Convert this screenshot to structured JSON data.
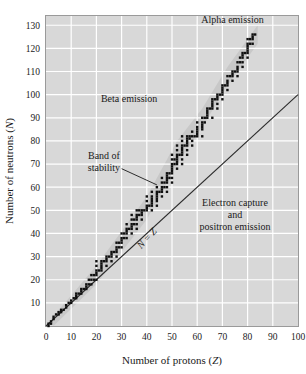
{
  "chart_data": {
    "type": "scatter",
    "title": "",
    "xlabel": "Number of protons (Z)",
    "ylabel": "Number of neutrons (N)",
    "xlim": [
      0,
      100
    ],
    "ylim": [
      0,
      134
    ],
    "grid": true,
    "grid_color": "#ffffff",
    "plot_bg": "#d8d8d8",
    "band_color": "#c6c6c6",
    "point_color": "#101010",
    "line_color": "#2b2b2b",
    "xticks": [
      0,
      10,
      20,
      30,
      40,
      50,
      60,
      70,
      80,
      90,
      100
    ],
    "yticks": [
      10,
      20,
      30,
      40,
      50,
      60,
      70,
      80,
      90,
      100,
      110,
      120,
      130
    ],
    "legend_position": "none",
    "annotations": [
      {
        "name": "alpha-emission",
        "text": "Alpha emission",
        "x": 74,
        "y": 131,
        "anchor": "middle"
      },
      {
        "name": "beta-emission",
        "text": "Beta emission",
        "x": 33,
        "y": 97,
        "anchor": "middle"
      },
      {
        "name": "band-of-stability",
        "text": "Band of stability",
        "lines": [
          "Band of",
          "stability"
        ],
        "x": 23,
        "y": 72,
        "anchor": "middle"
      },
      {
        "name": "electron-capture",
        "text": "Electron capture and positron emission",
        "lines": [
          "Electron capture",
          "and",
          "positron emission"
        ],
        "x": 75,
        "y": 52,
        "anchor": "middle"
      },
      {
        "name": "n-equals-z",
        "text": "N = Z",
        "x": 41,
        "y": 37,
        "rotation": -48
      }
    ],
    "reference_line": {
      "name": "n-equals-z-line",
      "label": "N = Z",
      "from": [
        0,
        0
      ],
      "to": [
        100,
        100
      ]
    },
    "leader_line": {
      "name": "band-of-stability-leader",
      "from": [
        30,
        68
      ],
      "to": [
        44,
        61
      ]
    },
    "series": [
      {
        "name": "Stable nuclides",
        "marker": "square",
        "points": [
          [
            1,
            0
          ],
          [
            1,
            1
          ],
          [
            2,
            1
          ],
          [
            2,
            2
          ],
          [
            3,
            3
          ],
          [
            3,
            4
          ],
          [
            4,
            5
          ],
          [
            5,
            5
          ],
          [
            5,
            6
          ],
          [
            6,
            6
          ],
          [
            6,
            7
          ],
          [
            7,
            7
          ],
          [
            8,
            8
          ],
          [
            8,
            9
          ],
          [
            9,
            10
          ],
          [
            10,
            10
          ],
          [
            10,
            11
          ],
          [
            11,
            12
          ],
          [
            12,
            12
          ],
          [
            12,
            13
          ],
          [
            12,
            14
          ],
          [
            13,
            14
          ],
          [
            14,
            14
          ],
          [
            14,
            15
          ],
          [
            14,
            16
          ],
          [
            15,
            16
          ],
          [
            16,
            16
          ],
          [
            16,
            17
          ],
          [
            16,
            18
          ],
          [
            17,
            18
          ],
          [
            17,
            20
          ],
          [
            18,
            18
          ],
          [
            18,
            20
          ],
          [
            18,
            22
          ],
          [
            19,
            20
          ],
          [
            19,
            22
          ],
          [
            20,
            20
          ],
          [
            20,
            22
          ],
          [
            20,
            23
          ],
          [
            20,
            24
          ],
          [
            20,
            26
          ],
          [
            20,
            28
          ],
          [
            21,
            24
          ],
          [
            22,
            24
          ],
          [
            22,
            25
          ],
          [
            22,
            26
          ],
          [
            22,
            27
          ],
          [
            22,
            28
          ],
          [
            23,
            28
          ],
          [
            24,
            26
          ],
          [
            24,
            28
          ],
          [
            24,
            29
          ],
          [
            24,
            30
          ],
          [
            25,
            30
          ],
          [
            26,
            28
          ],
          [
            26,
            30
          ],
          [
            26,
            31
          ],
          [
            26,
            32
          ],
          [
            27,
            32
          ],
          [
            28,
            30
          ],
          [
            28,
            32
          ],
          [
            28,
            33
          ],
          [
            28,
            34
          ],
          [
            28,
            36
          ],
          [
            29,
            34
          ],
          [
            29,
            36
          ],
          [
            30,
            34
          ],
          [
            30,
            36
          ],
          [
            30,
            37
          ],
          [
            30,
            38
          ],
          [
            30,
            40
          ],
          [
            31,
            38
          ],
          [
            31,
            40
          ],
          [
            32,
            38
          ],
          [
            32,
            40
          ],
          [
            32,
            41
          ],
          [
            32,
            42
          ],
          [
            32,
            44
          ],
          [
            33,
            42
          ],
          [
            34,
            40
          ],
          [
            34,
            42
          ],
          [
            34,
            43
          ],
          [
            34,
            44
          ],
          [
            34,
            46
          ],
          [
            34,
            48
          ],
          [
            35,
            44
          ],
          [
            35,
            46
          ],
          [
            36,
            42
          ],
          [
            36,
            44
          ],
          [
            36,
            46
          ],
          [
            36,
            47
          ],
          [
            36,
            48
          ],
          [
            36,
            50
          ],
          [
            37,
            48
          ],
          [
            37,
            50
          ],
          [
            38,
            46
          ],
          [
            38,
            48
          ],
          [
            38,
            49
          ],
          [
            38,
            50
          ],
          [
            39,
            50
          ],
          [
            40,
            50
          ],
          [
            40,
            51
          ],
          [
            40,
            52
          ],
          [
            40,
            54
          ],
          [
            40,
            56
          ],
          [
            41,
            52
          ],
          [
            42,
            50
          ],
          [
            42,
            52
          ],
          [
            42,
            53
          ],
          [
            42,
            54
          ],
          [
            42,
            55
          ],
          [
            42,
            56
          ],
          [
            42,
            58
          ],
          [
            44,
            52
          ],
          [
            44,
            54
          ],
          [
            44,
            55
          ],
          [
            44,
            56
          ],
          [
            44,
            57
          ],
          [
            44,
            58
          ],
          [
            44,
            60
          ],
          [
            45,
            58
          ],
          [
            46,
            56
          ],
          [
            46,
            58
          ],
          [
            46,
            59
          ],
          [
            46,
            60
          ],
          [
            46,
            62
          ],
          [
            46,
            64
          ],
          [
            47,
            60
          ],
          [
            47,
            62
          ],
          [
            48,
            58
          ],
          [
            48,
            60
          ],
          [
            48,
            62
          ],
          [
            48,
            63
          ],
          [
            48,
            64
          ],
          [
            48,
            65
          ],
          [
            48,
            66
          ],
          [
            49,
            64
          ],
          [
            49,
            66
          ],
          [
            50,
            62
          ],
          [
            50,
            64
          ],
          [
            50,
            66
          ],
          [
            50,
            67
          ],
          [
            50,
            68
          ],
          [
            50,
            69
          ],
          [
            50,
            70
          ],
          [
            50,
            72
          ],
          [
            50,
            74
          ],
          [
            51,
            70
          ],
          [
            51,
            72
          ],
          [
            52,
            68
          ],
          [
            52,
            70
          ],
          [
            52,
            71
          ],
          [
            52,
            72
          ],
          [
            52,
            73
          ],
          [
            52,
            74
          ],
          [
            52,
            76
          ],
          [
            52,
            78
          ],
          [
            53,
            74
          ],
          [
            54,
            70
          ],
          [
            54,
            72
          ],
          [
            54,
            74
          ],
          [
            54,
            75
          ],
          [
            54,
            76
          ],
          [
            54,
            77
          ],
          [
            54,
            78
          ],
          [
            54,
            80
          ],
          [
            54,
            82
          ],
          [
            55,
            78
          ],
          [
            56,
            74
          ],
          [
            56,
            76
          ],
          [
            56,
            78
          ],
          [
            56,
            79
          ],
          [
            56,
            80
          ],
          [
            56,
            81
          ],
          [
            56,
            82
          ],
          [
            57,
            81
          ],
          [
            57,
            82
          ],
          [
            58,
            78
          ],
          [
            58,
            80
          ],
          [
            58,
            82
          ],
          [
            58,
            84
          ],
          [
            59,
            82
          ],
          [
            60,
            82
          ],
          [
            60,
            83
          ],
          [
            60,
            84
          ],
          [
            60,
            85
          ],
          [
            60,
            86
          ],
          [
            60,
            88
          ],
          [
            62,
            82
          ],
          [
            62,
            85
          ],
          [
            62,
            86
          ],
          [
            62,
            87
          ],
          [
            62,
            88
          ],
          [
            62,
            90
          ],
          [
            63,
            88
          ],
          [
            63,
            90
          ],
          [
            64,
            90
          ],
          [
            64,
            91
          ],
          [
            64,
            92
          ],
          [
            64,
            93
          ],
          [
            64,
            94
          ],
          [
            65,
            94
          ],
          [
            66,
            90
          ],
          [
            66,
            94
          ],
          [
            66,
            95
          ],
          [
            66,
            96
          ],
          [
            66,
            97
          ],
          [
            66,
            98
          ],
          [
            67,
            98
          ],
          [
            68,
            94
          ],
          [
            68,
            96
          ],
          [
            68,
            98
          ],
          [
            68,
            99
          ],
          [
            68,
            100
          ],
          [
            69,
            100
          ],
          [
            70,
            98
          ],
          [
            70,
            100
          ],
          [
            70,
            101
          ],
          [
            70,
            102
          ],
          [
            70,
            103
          ],
          [
            70,
            104
          ],
          [
            71,
            104
          ],
          [
            72,
            102
          ],
          [
            72,
            104
          ],
          [
            72,
            105
          ],
          [
            72,
            106
          ],
          [
            72,
            108
          ],
          [
            73,
            108
          ],
          [
            74,
            106
          ],
          [
            74,
            108
          ],
          [
            74,
            109
          ],
          [
            74,
            110
          ],
          [
            75,
            110
          ],
          [
            76,
            108
          ],
          [
            76,
            110
          ],
          [
            76,
            111
          ],
          [
            76,
            112
          ],
          [
            76,
            114
          ],
          [
            77,
            114
          ],
          [
            77,
            116
          ],
          [
            78,
            112
          ],
          [
            78,
            114
          ],
          [
            78,
            116
          ],
          [
            78,
            117
          ],
          [
            78,
            118
          ],
          [
            79,
            118
          ],
          [
            80,
            116
          ],
          [
            80,
            118
          ],
          [
            80,
            119
          ],
          [
            80,
            120
          ],
          [
            80,
            121
          ],
          [
            80,
            122
          ],
          [
            80,
            124
          ],
          [
            81,
            122
          ],
          [
            81,
            124
          ],
          [
            82,
            122
          ],
          [
            82,
            124
          ],
          [
            82,
            125
          ],
          [
            82,
            126
          ],
          [
            83,
            126
          ]
        ]
      }
    ]
  },
  "figure": {
    "name": "band-of-stability-chart"
  }
}
